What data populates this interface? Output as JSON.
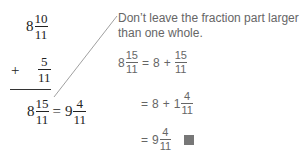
{
  "left_work": {
    "addend1": {
      "whole": "8",
      "num": "10",
      "den": "11"
    },
    "plus_sign": "+",
    "addend2": {
      "num": "5",
      "den": "11"
    },
    "result": {
      "whole": "8",
      "num": "15",
      "den": "11",
      "equals": "=",
      "simplified_whole": "9",
      "simplified_num": "4",
      "simplified_den": "11"
    }
  },
  "note": {
    "line1": "Don’t leave the fraction part larger",
    "line2": "than one whole."
  },
  "steps": [
    {
      "lhs_whole": "8",
      "lhs_num": "15",
      "lhs_den": "11",
      "equals": "=",
      "term1": "8",
      "plus": "+",
      "num": "15",
      "den": "11"
    },
    {
      "equals": "=",
      "term1": "8",
      "plus": "+",
      "whole": "1",
      "num": "4",
      "den": "11"
    },
    {
      "equals": "=",
      "whole": "9",
      "num": "4",
      "den": "11",
      "end_mark": "filled-square"
    }
  ],
  "colors": {
    "math_text": "#222222",
    "note_text": "#666666",
    "end_mark": "#777777",
    "leader_line": "#888888"
  }
}
